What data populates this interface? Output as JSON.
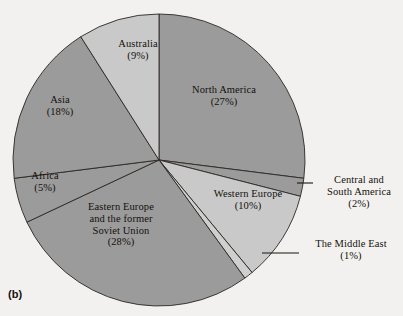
{
  "figure": {
    "caption": "(b)",
    "background_color": "#f3f1ef",
    "outline_color": "#2b2723"
  },
  "chart_data": {
    "type": "pie",
    "title": "",
    "subtitle": "",
    "xlabel": "",
    "ylabel": "",
    "legend_position": "none",
    "grid": false,
    "start_angle_deg": 0,
    "direction": "clockwise",
    "center_px": [
      159,
      160
    ],
    "radius_px": 146,
    "categories": [
      "North America",
      "Central and South America",
      "Western Europe",
      "The Middle East",
      "Eastern Europe and the former Soviet Union",
      "Africa",
      "Asia",
      "Australia"
    ],
    "values": [
      27,
      2,
      10,
      1,
      28,
      5,
      18,
      9
    ],
    "value_unit": "%",
    "colors": [
      "#9b9b9b",
      "#9b9b9b",
      "#c9c9c9",
      "#cfcfcf",
      "#9b9b9b",
      "#9b9b9b",
      "#9b9b9b",
      "#c9c9c9"
    ],
    "slices": [
      {
        "name": "North America",
        "value": 27,
        "label_text": "North America",
        "pct_text": "(27%)",
        "color": "#9b9b9b",
        "callout": false
      },
      {
        "name": "Central and South America",
        "value": 2,
        "label_line1": "Central and",
        "label_line2": "South America",
        "pct_text": "(2%)",
        "color": "#9b9b9b",
        "callout": true
      },
      {
        "name": "Western Europe",
        "value": 10,
        "label_text": "Western Europe",
        "pct_text": "(10%)",
        "color": "#c9c9c9",
        "callout": false
      },
      {
        "name": "The Middle East",
        "value": 1,
        "label_text": "The Middle East",
        "pct_text": "(1%)",
        "color": "#cfcfcf",
        "callout": true
      },
      {
        "name": "Eastern Europe and the former Soviet Union",
        "value": 28,
        "label_line1": "Eastern Europe",
        "label_line2": "and the former",
        "label_line3": "Soviet Union",
        "pct_text": "(28%)",
        "color": "#9b9b9b",
        "callout": false
      },
      {
        "name": "Africa",
        "value": 5,
        "label_text": "Africa",
        "pct_text": "(5%)",
        "color": "#9b9b9b",
        "callout": false
      },
      {
        "name": "Asia",
        "value": 18,
        "label_text": "Asia",
        "pct_text": "(18%)",
        "color": "#9b9b9b",
        "callout": false
      },
      {
        "name": "Australia",
        "value": 9,
        "label_text": "Australia",
        "pct_text": "(9%)",
        "color": "#c9c9c9",
        "callout": false
      }
    ]
  },
  "labels": {
    "north_america": {
      "name": "North America",
      "pct": "(27%)"
    },
    "australia": {
      "name": "Australia",
      "pct": "(9%)"
    },
    "asia": {
      "name": "Asia",
      "pct": "(18%)"
    },
    "africa": {
      "name": "Africa",
      "pct": "(5%)"
    },
    "eastern_europe": {
      "line1": "Eastern Europe",
      "line2": "and the former",
      "line3": "Soviet Union",
      "pct": "(28%)"
    },
    "western_europe": {
      "name": "Western Europe",
      "pct": "(10%)"
    },
    "central_south_america": {
      "line1": "Central and",
      "line2": "South America",
      "pct": "(2%)"
    },
    "middle_east": {
      "name": "The Middle East",
      "pct": "(1%)"
    }
  }
}
